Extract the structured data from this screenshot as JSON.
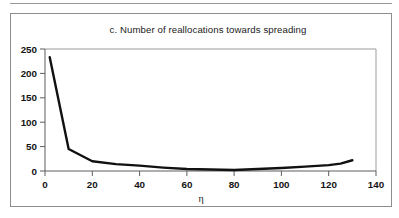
{
  "figure": {
    "border_color": "#8d8d8d",
    "background": "#ffffff"
  },
  "chart_data": {
    "type": "line",
    "title": "c. Number of reallocations towards spreading",
    "xlabel": "η",
    "ylabel": "",
    "xlim": [
      0,
      140
    ],
    "ylim": [
      0,
      250
    ],
    "xticks": [
      0,
      20,
      40,
      60,
      80,
      100,
      120,
      140
    ],
    "yticks": [
      0,
      50,
      100,
      150,
      200,
      250
    ],
    "xtick_labels": [
      "0",
      "20",
      "40",
      "60",
      "80",
      "100",
      "120",
      "140"
    ],
    "ytick_labels": [
      "0",
      "50",
      "100",
      "150",
      "200",
      "250"
    ],
    "grid": false,
    "legend": null,
    "line_color": "#111111",
    "series": [
      {
        "name": "Number of reallocations towards spreading",
        "x": [
          2,
          10,
          20,
          30,
          40,
          50,
          60,
          70,
          80,
          90,
          100,
          110,
          120,
          125,
          130
        ],
        "values": [
          233,
          45,
          20,
          14,
          11,
          7,
          4,
          3,
          2,
          4,
          6,
          9,
          12,
          15,
          22
        ]
      }
    ]
  }
}
